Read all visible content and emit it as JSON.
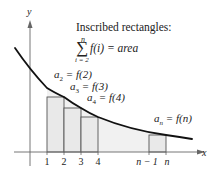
{
  "diagram": {
    "title": "Inscribed rectangles:",
    "formula": {
      "sum_upper": "n",
      "sum_lower": "i = 2",
      "body": "f(i) = area"
    },
    "axes": {
      "x_label": "x",
      "y_label": "y"
    },
    "x_ticks": [
      "1",
      "2",
      "3",
      "4",
      "n − 1",
      "n"
    ],
    "annotations": [
      {
        "lhs": "a",
        "sub": "2",
        "rhs": " = f(2)"
      },
      {
        "lhs": "a",
        "sub": "3",
        "rhs": " = f(3)"
      },
      {
        "lhs": "a",
        "sub": "4",
        "rhs": " = f(4)"
      },
      {
        "lhs": "a",
        "sub": "n",
        "rhs": " = f(n)"
      }
    ],
    "colors": {
      "curve": "#111111",
      "rect_fill": "#ebebeb",
      "rect_stroke": "#555555",
      "axis": "#666666"
    }
  }
}
